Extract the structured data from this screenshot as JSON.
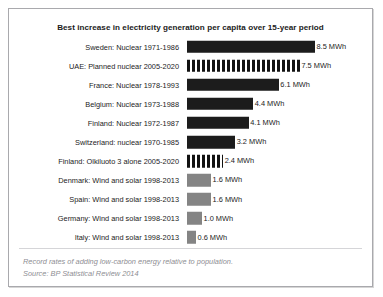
{
  "chart_data": {
    "type": "bar",
    "orientation": "horizontal",
    "title": "Best increase in electricity generation per capita over 15-year period",
    "xlabel": "",
    "ylabel": "",
    "unit": "MWh",
    "xlim": [
      0,
      8.5
    ],
    "grid": false,
    "legend": "none",
    "categories": [
      "Sweden: Nuclear 1971-1986",
      "UAE: Planned nuclear 2005-2020",
      "France: Nuclear 1978-1993",
      "Belgium: Nuclear 1973-1988",
      "Finland: Nuclear 1972-1987",
      "Switzerland: nuclear 1970-1985",
      "Finland: Olkiluoto 3 alone 2005-2020",
      "Denmark: Wind and solar 1998-2013",
      "Spain: Wind and solar 1998-2013",
      "Germany: Wind and solar 1998-2013",
      "Italy: Wind and solar 1998-2013"
    ],
    "values": [
      8.5,
      7.5,
      6.1,
      4.4,
      4.1,
      3.2,
      2.4,
      1.6,
      1.6,
      1.0,
      0.6
    ],
    "value_labels": [
      "8.5 MWh",
      "7.5 MWh",
      "6.1 MWh",
      "4.4 MWh",
      "4.1 MWh",
      "3.2 MWh",
      "2.4 MWh",
      "1.6 MWh",
      "1.6 MWh",
      "1.0 MWh",
      "0.6 MWh"
    ],
    "bar_styles": [
      "solid-dark",
      "striped",
      "solid-dark",
      "solid-dark",
      "solid-dark",
      "solid-dark",
      "striped",
      "solid-gray",
      "solid-gray",
      "solid-gray",
      "solid-gray"
    ],
    "colors": {
      "solid_dark": "#1c1c1c",
      "solid_gray": "#848484",
      "striped_fore": "#121212",
      "striped_back": "#ffffff",
      "text": "#1b1b1b",
      "caption": "#8e8e93",
      "border": "#a9a9ad"
    },
    "rows": [
      {
        "label": "Sweden: Nuclear 1971-1986",
        "value": 8.5,
        "value_label": "8.5 MWh",
        "style": "solid-dark"
      },
      {
        "label": "UAE: Planned nuclear 2005-2020",
        "value": 7.5,
        "value_label": "7.5 MWh",
        "style": "striped"
      },
      {
        "label": "France: Nuclear 1978-1993",
        "value": 6.1,
        "value_label": "6.1 MWh",
        "style": "solid-dark"
      },
      {
        "label": "Belgium: Nuclear 1973-1988",
        "value": 4.4,
        "value_label": "4.4 MWh",
        "style": "solid-dark"
      },
      {
        "label": "Finland: Nuclear 1972-1987",
        "value": 4.1,
        "value_label": "4.1 MWh",
        "style": "solid-dark"
      },
      {
        "label": "Switzerland: nuclear 1970-1985",
        "value": 3.2,
        "value_label": "3.2 MWh",
        "style": "solid-dark"
      },
      {
        "label": "Finland: Olkiluoto 3 alone 2005-2020",
        "value": 2.4,
        "value_label": "2.4 MWh",
        "style": "striped"
      },
      {
        "label": "Denmark: Wind and solar 1998-2013",
        "value": 1.6,
        "value_label": "1.6 MWh",
        "style": "solid-gray"
      },
      {
        "label": "Spain: Wind and solar 1998-2013",
        "value": 1.6,
        "value_label": "1.6 MWh",
        "style": "solid-gray"
      },
      {
        "label": "Germany: Wind and solar 1998-2013",
        "value": 1.0,
        "value_label": "1.0 MWh",
        "style": "solid-gray"
      },
      {
        "label": "Italy: Wind and solar 1998-2013",
        "value": 0.6,
        "value_label": "0.6 MWh",
        "style": "solid-gray"
      }
    ]
  },
  "footer": {
    "caption": "Record rates of adding low-carbon energy relative to population.",
    "source": "Source: BP Statistical Review 2014"
  }
}
